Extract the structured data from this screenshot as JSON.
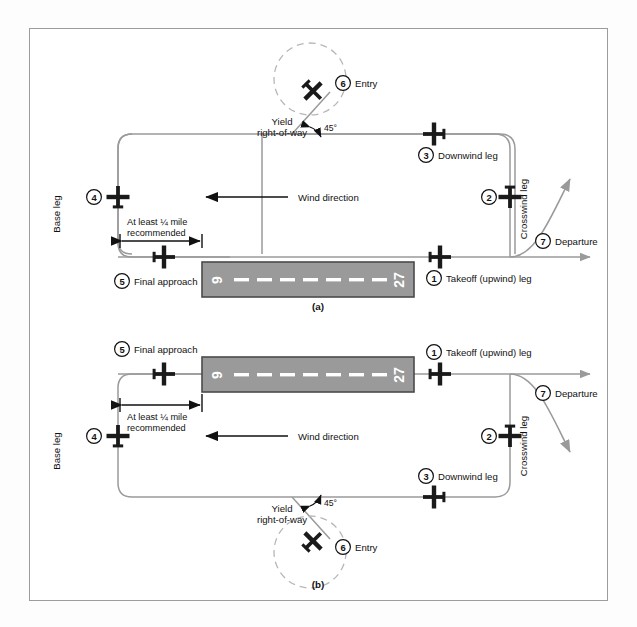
{
  "figure": {
    "panels": [
      {
        "id": "a",
        "caption": "(a)",
        "pattern_direction": "left-hand (counterclockwise)",
        "runway": {
          "left_number": "9",
          "right_number": "27",
          "centerline_style": "dashed-white"
        },
        "wind": {
          "label": "Wind direction",
          "arrow": "left"
        },
        "entry_angle": "45°",
        "notes": {
          "yield": "Yield\nright-of-way",
          "yield_line1": "Yield",
          "yield_line2": "right-of-way",
          "distance_line1": "At least ¼ mile",
          "distance_line2": "recommended"
        },
        "legs": [
          {
            "number": "1",
            "label": "Takeoff (upwind) leg"
          },
          {
            "number": "2",
            "label": ""
          },
          {
            "number": "3",
            "label": "Downwind leg"
          },
          {
            "number": "4",
            "label": ""
          },
          {
            "number": "5",
            "label": "Final approach"
          },
          {
            "number": "6",
            "label": "Entry"
          },
          {
            "number": "7",
            "label": "Departure"
          }
        ],
        "vertical_labels": [
          {
            "name": "base-leg",
            "text": "Base leg"
          },
          {
            "name": "crosswind-leg",
            "text": "Crosswind leg"
          }
        ]
      },
      {
        "id": "b",
        "caption": "(b)",
        "pattern_direction": "right-hand (clockwise)",
        "runway": {
          "left_number": "9",
          "right_number": "27",
          "centerline_style": "dashed-white"
        },
        "wind": {
          "label": "Wind direction",
          "arrow": "left"
        },
        "entry_angle": "45°",
        "notes": {
          "yield_line1": "Yield",
          "yield_line2": "right-of-way",
          "distance_line1": "At least ¼ mile",
          "distance_line2": "recommended"
        },
        "legs": [
          {
            "number": "1",
            "label": "Takeoff (upwind) leg"
          },
          {
            "number": "2",
            "label": ""
          },
          {
            "number": "3",
            "label": "Downwind leg"
          },
          {
            "number": "4",
            "label": ""
          },
          {
            "number": "5",
            "label": "Final approach"
          },
          {
            "number": "6",
            "label": "Entry"
          },
          {
            "number": "7",
            "label": "Departure"
          }
        ],
        "vertical_labels": [
          {
            "name": "base-leg",
            "text": "Base leg"
          },
          {
            "name": "crosswind-leg",
            "text": "Crosswind leg"
          }
        ]
      }
    ],
    "colors": {
      "runway_fill": "#9a9a9a",
      "runway_stroke": "#4a4a4a",
      "pattern_line": "#9a9a9a",
      "aircraft": "#1a1a1a",
      "frame": "#9c9c9c",
      "text": "#111111",
      "dash_white": "#ffffff"
    }
  }
}
